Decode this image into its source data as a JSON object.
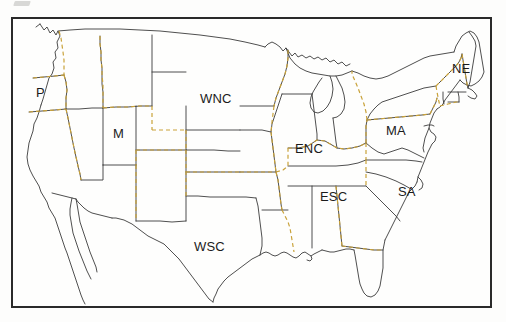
{
  "figure": {
    "kind": "map",
    "background_color": "#fdfdfc",
    "frame_color": "#2a2a2a",
    "state_outline_color": "#3b3b3b",
    "division_boundary_color": "#c9a23a",
    "division_boundary_style": "dashed",
    "label_color": "#1b1b1b"
  },
  "frame": {
    "x": 11,
    "y": 17,
    "width": 481,
    "height": 291
  },
  "regions": [
    {
      "code": "P",
      "label": "P",
      "name": "Pacific",
      "x": 36,
      "y": 86,
      "anchor": "left"
    },
    {
      "code": "M",
      "label": "M",
      "name": "Mountain",
      "x": 113,
      "y": 127,
      "anchor": "left"
    },
    {
      "code": "WNC",
      "label": "WNC",
      "name": "West North Central",
      "x": 200,
      "y": 92,
      "anchor": "left"
    },
    {
      "code": "WSC",
      "label": "WSC",
      "name": "West South Central",
      "x": 194,
      "y": 240,
      "anchor": "left"
    },
    {
      "code": "ENC",
      "label": "ENC",
      "name": "East North Central",
      "x": 295,
      "y": 142,
      "anchor": "left"
    },
    {
      "code": "ESC",
      "label": "ESC",
      "name": "East South Central",
      "x": 320,
      "y": 190,
      "anchor": "left"
    },
    {
      "code": "SA",
      "label": "SA",
      "name": "South Atlantic",
      "x": 398,
      "y": 185,
      "anchor": "left"
    },
    {
      "code": "MA",
      "label": "MA",
      "name": "Middle Atlantic",
      "x": 386,
      "y": 124,
      "anchor": "left"
    },
    {
      "code": "NE",
      "label": "NE",
      "name": "New England",
      "x": 452,
      "y": 62,
      "anchor": "left"
    }
  ]
}
